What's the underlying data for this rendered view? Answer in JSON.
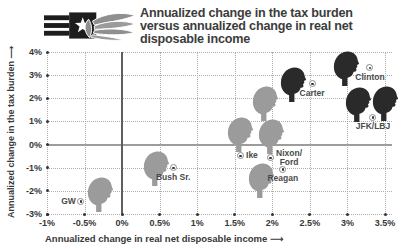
{
  "header": {
    "title_lines": [
      "Annualized change in the tax burden",
      "versus annualized change in real net",
      "disposable income"
    ]
  },
  "icons": {
    "axis_arrow": "⟶",
    "logo": "stars-stripes-hand"
  },
  "colors": {
    "republican_gray": "#9b9b9b",
    "democrat_dark": "#2a2a2a",
    "grid": "#adadad",
    "axis_text": "#383838",
    "annotation_text": "#4a4a4a",
    "title_text": "#3c3c3c"
  },
  "chart_data": {
    "type": "scatter",
    "title": "Annualized change in the tax burden versus annualized change in real net disposable income",
    "xlabel": "Annualized change in real net disposable income",
    "ylabel": "Annualized change in the tax burden",
    "xlim": [
      -1,
      3.5
    ],
    "ylim": [
      -3,
      4
    ],
    "grid": "dotted",
    "legend": "none",
    "x_ticks": [
      {
        "value": -1,
        "label": "-1%"
      },
      {
        "value": -0.5,
        "label": "-0.5%"
      },
      {
        "value": 0,
        "label": "0%"
      },
      {
        "value": 0.5,
        "label": "0.5%"
      },
      {
        "value": 1,
        "label": "1%"
      },
      {
        "value": 1.5,
        "label": "1.5%"
      },
      {
        "value": 2,
        "label": "2%"
      },
      {
        "value": 2.5,
        "label": "2.5%"
      },
      {
        "value": 3,
        "label": "3%"
      },
      {
        "value": 3.5,
        "label": "3.5%"
      }
    ],
    "y_ticks": [
      {
        "value": 4,
        "label": "4%"
      },
      {
        "value": 3,
        "label": "3%"
      },
      {
        "value": 2,
        "label": "2%"
      },
      {
        "value": 1,
        "label": "1%"
      },
      {
        "value": 0,
        "label": "0%"
      },
      {
        "value": -1,
        "label": "-1%"
      },
      {
        "value": -2,
        "label": "-2%"
      },
      {
        "value": -3,
        "label": "-3%"
      }
    ],
    "series": [
      {
        "name": "republican-presidents",
        "color": "#9b9b9b",
        "points": [
          {
            "label": "GW",
            "x": -0.3,
            "y": -2.1
          },
          {
            "label": "Bush Sr.",
            "x": 0.44,
            "y": -1.0
          },
          {
            "label": "Ike",
            "x": 1.56,
            "y": 0.5
          },
          {
            "label": "Nixon",
            "x": 1.89,
            "y": 1.8
          },
          {
            "label": "Ford",
            "x": 1.98,
            "y": 0.38
          },
          {
            "label": "Reagan",
            "x": 1.84,
            "y": -1.52
          }
        ]
      },
      {
        "name": "democrat-presidents",
        "color": "#2a2a2a",
        "points": [
          {
            "label": "Carter",
            "x": 2.27,
            "y": 2.66
          },
          {
            "label": "Clinton",
            "x": 2.98,
            "y": 3.35
          },
          {
            "label": "JFK",
            "x": 3.14,
            "y": 1.78
          },
          {
            "label": "LBJ",
            "x": 3.49,
            "y": 1.8
          }
        ]
      }
    ],
    "annotations": [
      {
        "label_lines": [
          "GW"
        ],
        "marker_x": -0.55,
        "marker_y": -2.44,
        "label_side": "left"
      },
      {
        "label_lines": [
          "Bush Sr."
        ],
        "marker_x": 0.68,
        "marker_y": -1.01,
        "label_side": "below"
      },
      {
        "label_lines": [
          "Ike"
        ],
        "marker_x": 1.57,
        "marker_y": -0.49,
        "label_side": "right"
      },
      {
        "label_lines": [
          "Nixon/",
          "Ford"
        ],
        "marker_x": 1.97,
        "marker_y": -0.58,
        "label_side": "right"
      },
      {
        "label_lines": [
          "Reagan"
        ],
        "marker_x": 2.14,
        "marker_y": -1.06,
        "label_side": "below"
      },
      {
        "label_lines": [
          "Carter"
        ],
        "marker_x": 2.53,
        "marker_y": 2.62,
        "label_side": "below"
      },
      {
        "label_lines": [
          "Clinton"
        ],
        "marker_x": 3.3,
        "marker_y": 3.31,
        "label_side": "below"
      },
      {
        "label_lines": [
          "JFK/LBJ"
        ],
        "marker_x": 3.34,
        "marker_y": 1.19,
        "label_side": "below"
      }
    ]
  }
}
